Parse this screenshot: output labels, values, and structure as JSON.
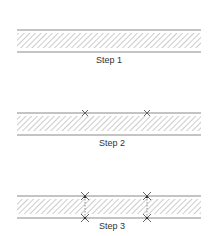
{
  "diagram": {
    "title": "",
    "steps": [
      {
        "label": "Step 1",
        "top_marks": 0,
        "bottom_marks": 0,
        "connectors": false
      },
      {
        "label": "Step 2",
        "top_marks": 2,
        "bottom_marks": 0,
        "connectors": false
      },
      {
        "label": "Step 3",
        "top_marks": 2,
        "bottom_marks": 2,
        "connectors": true
      }
    ],
    "colors": {
      "line": "#8a8a8a",
      "hatch": "#9a9a9a",
      "mark": "#555555",
      "text": "#333333"
    }
  }
}
